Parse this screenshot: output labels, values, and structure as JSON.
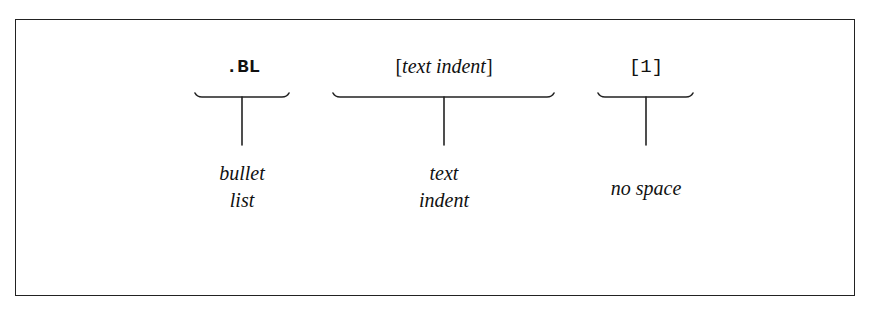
{
  "diagram": {
    "segments": [
      {
        "id": "macro",
        "syntax": ".BL",
        "style": "monospace-bold",
        "label_lines": [
          "bullet",
          "list"
        ]
      },
      {
        "id": "indent",
        "syntax_open": "[",
        "syntax_text": "text indent",
        "syntax_close": "]",
        "style": "serif-italic-in-brackets",
        "label_lines": [
          "text",
          "indent"
        ]
      },
      {
        "id": "spacing",
        "syntax": "[1]",
        "style": "monospace",
        "label_lines": [
          "no space"
        ]
      }
    ],
    "colors": {
      "ink": "#111111",
      "frame": "#222222",
      "background": "#ffffff"
    }
  }
}
